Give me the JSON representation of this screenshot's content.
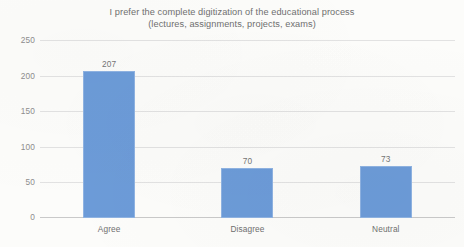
{
  "chart_data": {
    "type": "bar",
    "title": "I prefer the complete digitization of the educational process (lectures, assignments, projects, exams)",
    "title_lines": [
      "I prefer the complete digitization of the educational process",
      "(lectures, assignments, projects, exams)"
    ],
    "categories": [
      "Agree",
      "Disagree",
      "Neutral"
    ],
    "values": [
      207,
      70,
      73
    ],
    "data_labels": [
      "207",
      "70",
      "73"
    ],
    "xlabel": "",
    "ylabel": "",
    "ylim": [
      0,
      250
    ],
    "ytick_values": [
      250,
      200,
      150,
      100,
      50,
      0
    ],
    "ytick_labels": [
      "250",
      "200",
      "150",
      "100",
      "50",
      "0"
    ],
    "grid": true,
    "legend": false,
    "legend_position": "none",
    "series": [
      {
        "name": "Responses",
        "values": [
          207,
          70,
          73
        ],
        "color": "#6C9BD8"
      }
    ],
    "colors": {
      "bar_fill": "#6C9BD8",
      "bar_border": "#8FB3E2",
      "gridline": "#E2E2E2",
      "axis_line": "#C9C9C9",
      "title_text": "#6F6F6F",
      "tick_text": "#8D8D8D",
      "label_text": "#6F6F6F",
      "value_text": "#757575",
      "background": "#FCFCFA"
    }
  }
}
